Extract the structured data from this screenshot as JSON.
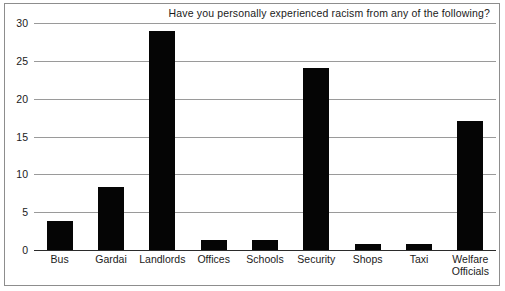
{
  "chart_data": {
    "type": "bar",
    "title": "Have you personally experienced racism from any of the following?",
    "xlabel": "",
    "ylabel": "",
    "categories": [
      "Bus",
      "Gardai",
      "Landlords",
      "Offices",
      "Schools",
      "Security",
      "Shops",
      "Taxi",
      "Welfare\nOfficials"
    ],
    "values": [
      3.8,
      8.3,
      29,
      1.3,
      1.3,
      24,
      0.8,
      0.8,
      17
    ],
    "ylim": [
      0,
      30
    ],
    "yticks": [
      0,
      5,
      10,
      15,
      20,
      25,
      30
    ],
    "ytick_labels": [
      "0",
      "5",
      "10",
      "15",
      "20",
      "25",
      "30"
    ],
    "grid": true,
    "legend": false,
    "bar_color": "#050505",
    "grid_color": "#9a9a9a",
    "axis_color": "#2b2b2b",
    "frame_color": "#8d8d8d",
    "background": "#ffffff"
  }
}
